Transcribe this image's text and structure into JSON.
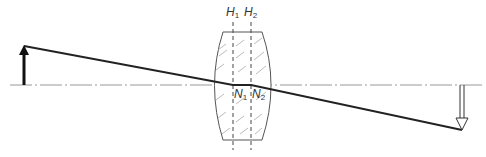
{
  "diagram": {
    "type": "thick-lens ray diagram",
    "labels": {
      "H1": {
        "main": "H",
        "sub": "1"
      },
      "H2": {
        "main": "H",
        "sub": "2"
      },
      "N1": {
        "main": "N",
        "sub": "1"
      },
      "N2": {
        "main": "N",
        "sub": "2"
      }
    },
    "elements": {
      "object_arrow": "solid upward arrow (object)",
      "image_arrow": "hollow downward arrow (inverted image)",
      "lens": "thick biconvex lens with hatched glass",
      "principal_planes": [
        "H1",
        "H2"
      ],
      "nodal_points": [
        "N1",
        "N2"
      ],
      "optical_axis": "dash-dot horizontal line"
    },
    "colors": {
      "line": "#222222",
      "axis": "#999999",
      "hatch": "#aaaaaa",
      "background": "#ffffff"
    }
  }
}
